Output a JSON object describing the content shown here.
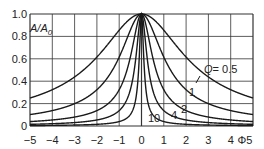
{
  "chart_data": {
    "type": "line",
    "title": "",
    "xlabel": "Φ",
    "ylabel": "A/A0",
    "xlim": [
      -5,
      5
    ],
    "ylim": [
      0,
      1.0
    ],
    "grid": true,
    "x_ticks": [
      "-5",
      "-4",
      "-3",
      "-2",
      "-1",
      "0",
      "1",
      "2",
      "3",
      "4",
      "5"
    ],
    "y_ticks": [
      "0",
      "0.2",
      "0.4",
      "0.6",
      "0.8",
      "1.0"
    ],
    "series": [
      {
        "name": "Q = 0.5",
        "label": "Q = 0.5",
        "Q": 0.5
      },
      {
        "name": "Q = 1",
        "label": "1",
        "Q": 1
      },
      {
        "name": "Q = 2",
        "label": "2",
        "Q": 2
      },
      {
        "name": "Q = 4",
        "label": "4",
        "Q": 4
      },
      {
        "name": "Q = 10",
        "label": "10",
        "Q": 10
      }
    ],
    "formula_note": "resonance curves, peak A/A0 = 1 at Φ = 0, narrowing with increasing Q"
  },
  "labels": {
    "y_axis": "A/A",
    "y_axis_sub": "0",
    "x_axis": "Φ",
    "q_prefix": "Q",
    "q_eq": "= 0.5",
    "c1": "1",
    "c2": "2",
    "c4": "4",
    "c10": "10"
  },
  "colors": {
    "line": "#1a1a1a",
    "grid": "#333333",
    "background": "#ffffff"
  }
}
